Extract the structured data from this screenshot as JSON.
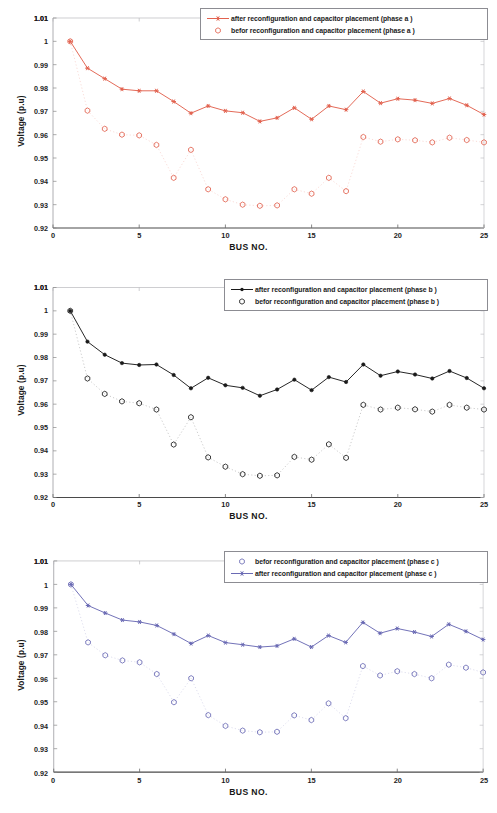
{
  "document": {
    "type": "scanned figure page",
    "figure_count": 3
  },
  "charts": [
    {
      "id": "phase-a",
      "axes": {
        "xlabel": "BUS NO.",
        "ylabel": "Voltage (p.u)",
        "xticks": [
          "0",
          "5",
          "10",
          "15",
          "20",
          "25"
        ],
        "yticks": [
          "0.92",
          "0.93",
          "0.94",
          "0.95",
          "0.96",
          "0.97",
          "0.98",
          "0.99",
          "1",
          "1.01"
        ],
        "xlim": [
          0,
          25
        ],
        "ylim": [
          0.92,
          1.01
        ]
      },
      "legend": {
        "position": "top-right",
        "entries": [
          {
            "label": "after reconfiguration and capacitor placement (phase a )",
            "marker": "line-with-star",
            "color": "#e2624f"
          },
          {
            "label": "befor reconfiguration and capacitor placement (phase a )",
            "marker": "open-hexagon",
            "color": "#e2624f"
          }
        ]
      },
      "accent_color": "#e2624f"
    },
    {
      "id": "phase-b",
      "axes": {
        "xlabel": "BUS NO.",
        "ylabel": "Voltage (p.u)",
        "xticks": [
          "0",
          "5",
          "10",
          "15",
          "20",
          "25"
        ],
        "yticks": [
          "0.92",
          "0.93",
          "0.94",
          "0.95",
          "0.96",
          "0.97",
          "0.98",
          "0.99",
          "1",
          "1.01"
        ],
        "xlim": [
          0,
          25
        ],
        "ylim": [
          0.92,
          1.01
        ]
      },
      "legend": {
        "position": "top-right",
        "entries": [
          {
            "label": "after reconfiguration and capacitor placement (phase b )",
            "marker": "line-with-dot",
            "color": "#1a1a1a"
          },
          {
            "label": "befor reconfiguration and capacitor placement (phase b )",
            "marker": "open-hexagon",
            "color": "#1a1a1a"
          }
        ]
      },
      "accent_color": "#1a1a1a"
    },
    {
      "id": "phase-c",
      "axes": {
        "xlabel": "BUS NO.",
        "ylabel": "Voltage (p.u)",
        "xticks": [
          "0",
          "5",
          "10",
          "15",
          "20",
          "25"
        ],
        "yticks": [
          "0.92",
          "0.93",
          "0.94",
          "0.95",
          "0.96",
          "0.97",
          "0.98",
          "0.99",
          "1",
          "1.01"
        ],
        "xlim": [
          0,
          25
        ],
        "ylim": [
          0.92,
          1.01
        ]
      },
      "legend": {
        "position": "top-right",
        "entries": [
          {
            "label": "befor reconfiguration and capacitor placement (phase c )",
            "marker": "open-hexagon",
            "color": "#6a6ab4"
          },
          {
            "label": "after reconfiguration and capacitor placement (phase c )",
            "marker": "line-with-star",
            "color": "#6a6ab4"
          }
        ]
      },
      "accent_color": "#6a6ab4"
    }
  ],
  "chart_data": [
    {
      "type": "line",
      "title": "",
      "xlabel": "BUS NO.",
      "ylabel": "Voltage (p.u)",
      "xlim": [
        0,
        25
      ],
      "ylim": [
        0.92,
        1.01
      ],
      "grid": false,
      "legend_position": "upper right",
      "x": [
        1,
        2,
        3,
        4,
        5,
        6,
        7,
        8,
        9,
        10,
        11,
        12,
        13,
        14,
        15,
        16,
        17,
        18,
        19,
        20,
        21,
        22,
        23,
        24,
        25
      ],
      "series": [
        {
          "name": "after reconfiguration and capacitor placement (phase a )",
          "color": "#e2624f",
          "marker": "star",
          "linestyle": "solid",
          "values": [
            1.0,
            0.9885,
            0.984,
            0.9795,
            0.9788,
            0.9788,
            0.9742,
            0.9692,
            0.9723,
            0.9702,
            0.9694,
            0.9657,
            0.9672,
            0.9715,
            0.9666,
            0.9723,
            0.9707,
            0.9785,
            0.9735,
            0.9754,
            0.9748,
            0.9734,
            0.9755,
            0.9726,
            0.9686
          ]
        },
        {
          "name": "befor reconfiguration and capacitor placement (phase a )",
          "color": "#e2624f",
          "marker": "hexagon-open",
          "linestyle": "dotted",
          "values": [
            1.0,
            0.9703,
            0.9625,
            0.96,
            0.9597,
            0.9556,
            0.9415,
            0.9535,
            0.9366,
            0.9323,
            0.93,
            0.9295,
            0.9297,
            0.9366,
            0.9347,
            0.9415,
            0.9358,
            0.959,
            0.957,
            0.958,
            0.9576,
            0.9567,
            0.9587,
            0.9577,
            0.9567
          ]
        }
      ]
    },
    {
      "type": "line",
      "title": "",
      "xlabel": "BUS NO.",
      "ylabel": "Voltage (p.u)",
      "xlim": [
        0,
        25
      ],
      "ylim": [
        0.92,
        1.01
      ],
      "grid": false,
      "legend_position": "upper right",
      "x": [
        1,
        2,
        3,
        4,
        5,
        6,
        7,
        8,
        9,
        10,
        11,
        12,
        13,
        14,
        15,
        16,
        17,
        18,
        19,
        20,
        21,
        22,
        23,
        24,
        25
      ],
      "series": [
        {
          "name": "after reconfiguration and capacitor placement (phase b )",
          "color": "#1a1a1a",
          "marker": "dot",
          "linestyle": "solid",
          "values": [
            1.0,
            0.9868,
            0.9812,
            0.9776,
            0.9768,
            0.977,
            0.9725,
            0.9668,
            0.9713,
            0.9681,
            0.967,
            0.9636,
            0.9663,
            0.9705,
            0.966,
            0.9716,
            0.9695,
            0.977,
            0.9722,
            0.974,
            0.9727,
            0.971,
            0.9742,
            0.9712,
            0.9668
          ]
        },
        {
          "name": "befor reconfiguration and capacitor placement (phase b )",
          "color": "#1a1a1a",
          "marker": "hexagon-open",
          "linestyle": "dotted",
          "values": [
            1.0,
            0.971,
            0.9644,
            0.9612,
            0.9604,
            0.9577,
            0.9427,
            0.9544,
            0.9372,
            0.9332,
            0.93,
            0.9293,
            0.9295,
            0.9374,
            0.9362,
            0.9428,
            0.937,
            0.9597,
            0.9577,
            0.9585,
            0.9578,
            0.9568,
            0.9597,
            0.9585,
            0.9577
          ]
        }
      ]
    },
    {
      "type": "line",
      "title": "",
      "xlabel": "BUS NO.",
      "ylabel": "Voltage (p.u)",
      "xlim": [
        0,
        25
      ],
      "ylim": [
        0.92,
        1.01
      ],
      "grid": false,
      "legend_position": "upper right",
      "x": [
        1,
        2,
        3,
        4,
        5,
        6,
        7,
        8,
        9,
        10,
        11,
        12,
        13,
        14,
        15,
        16,
        17,
        18,
        19,
        20,
        21,
        22,
        23,
        24,
        25
      ],
      "series": [
        {
          "name": "befor reconfiguration and capacitor placement (phase c )",
          "color": "#6a6ab4",
          "marker": "hexagon-open",
          "linestyle": "dotted",
          "values": [
            1.0,
            0.9753,
            0.9698,
            0.9676,
            0.9668,
            0.9618,
            0.9498,
            0.96,
            0.9443,
            0.9397,
            0.9377,
            0.937,
            0.9372,
            0.9442,
            0.9422,
            0.9493,
            0.943,
            0.9652,
            0.9612,
            0.963,
            0.9618,
            0.96,
            0.9658,
            0.9645,
            0.9625
          ]
        },
        {
          "name": "after reconfiguration and capacitor placement (phase c )",
          "color": "#6a6ab4",
          "marker": "star",
          "linestyle": "solid",
          "values": [
            1.0,
            0.991,
            0.9878,
            0.9848,
            0.984,
            0.9825,
            0.9788,
            0.9748,
            0.9782,
            0.9752,
            0.9743,
            0.9733,
            0.9738,
            0.9768,
            0.9733,
            0.9782,
            0.9753,
            0.9838,
            0.9792,
            0.9812,
            0.9797,
            0.9778,
            0.983,
            0.98,
            0.9765
          ]
        }
      ]
    }
  ]
}
